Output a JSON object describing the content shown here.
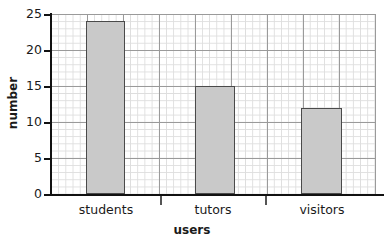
{
  "chart_data": {
    "type": "bar",
    "title": "",
    "categories": [
      "students",
      "tutors",
      "visitors"
    ],
    "values": [
      24,
      15,
      12
    ],
    "xlabel": "users",
    "ylabel": "number",
    "ylim": [
      0,
      25
    ],
    "ytick_labels": [
      "0",
      "5",
      "10",
      "15",
      "20",
      "25"
    ],
    "ytick_values": [
      0,
      5,
      10,
      15,
      20,
      25
    ],
    "grid": true,
    "grid_minor_step": 1,
    "grid_major_step": 5,
    "legend": "none",
    "bar_fill_color": "#c9c9c9",
    "bar_edge_color": "#4a4a4a",
    "grid_minor_color": "#dedede",
    "grid_major_color": "#9a9a9a",
    "axis_color": "#111111"
  },
  "axes": {
    "y_title": "number",
    "x_title": "users",
    "y_labels": {
      "t25": "25",
      "t20": "20",
      "t15": "15",
      "t10": "10",
      "t5": "5",
      "t0": "0"
    }
  },
  "categories": {
    "c0": "students",
    "c1": "tutors",
    "c2": "visitors"
  }
}
